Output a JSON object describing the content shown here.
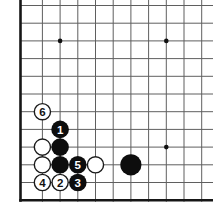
{
  "diagram": {
    "board": {
      "background_color": "#ffffff",
      "grid_line_color": "#5f5f5f",
      "edge_line_color": "#161616",
      "grid_line_width": 1,
      "edge_line_width": 2.6,
      "left_edge_x": 20.5,
      "bottom_edge_y": 200.3,
      "grid_right_end_x": 213,
      "grid_top_end_y": 0,
      "edge_bottom_start_x": 19.2,
      "vertical_line_bottom_y": 201.8,
      "thin_columns_x": [
        42.4,
        60.1,
        77.8,
        95.5,
        113.2,
        130.9,
        148.6,
        166.3,
        184.0,
        201.7
      ],
      "thin_rows_y": [
        5.5,
        23.2,
        40.9,
        58.6,
        76.3,
        94.0,
        111.7,
        129.4,
        147.1,
        164.8,
        182.5
      ],
      "star_point_radius": 2.3,
      "star_points": [
        {
          "x": 60.1,
          "y": 40.9
        },
        {
          "x": 166.3,
          "y": 40.9
        },
        {
          "x": 166.3,
          "y": 147.1
        }
      ]
    },
    "stones": {
      "black_fill": "#0d0d0d",
      "white_fill": "#ffffff",
      "white_stroke": "#1a1a1a",
      "white_stroke_width": 1.4,
      "radius": 8.8,
      "big_radius": 10.6,
      "number_font_size": 11.5,
      "number_color_on_black": "#ffffff",
      "number_color_on_white": "#111111",
      "list": [
        {
          "cx": 42.4,
          "cy": 111.7,
          "color": "white",
          "label": "6",
          "big": false
        },
        {
          "cx": 60.1,
          "cy": 129.4,
          "color": "black",
          "label": "1",
          "big": false
        },
        {
          "cx": 42.4,
          "cy": 147.1,
          "color": "white",
          "label": "",
          "big": false
        },
        {
          "cx": 60.1,
          "cy": 147.1,
          "color": "black",
          "label": "",
          "big": false
        },
        {
          "cx": 42.4,
          "cy": 164.8,
          "color": "white",
          "label": "",
          "big": false
        },
        {
          "cx": 60.1,
          "cy": 164.8,
          "color": "black",
          "label": "",
          "big": false
        },
        {
          "cx": 77.8,
          "cy": 164.8,
          "color": "black",
          "label": "5",
          "big": false
        },
        {
          "cx": 95.5,
          "cy": 164.8,
          "color": "white",
          "label": "",
          "big": false
        },
        {
          "cx": 130.9,
          "cy": 164.8,
          "color": "black",
          "label": "",
          "big": true
        },
        {
          "cx": 42.4,
          "cy": 182.5,
          "color": "white",
          "label": "4",
          "big": false
        },
        {
          "cx": 60.1,
          "cy": 182.5,
          "color": "white",
          "label": "2",
          "big": false
        },
        {
          "cx": 77.8,
          "cy": 182.5,
          "color": "black",
          "label": "3",
          "big": false
        }
      ]
    }
  }
}
